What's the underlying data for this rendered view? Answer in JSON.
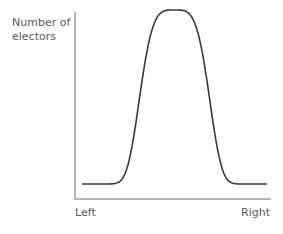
{
  "chart_data": {
    "type": "line",
    "title": "",
    "xlabel": "",
    "ylabel": "Number of electors",
    "x_tick_labels": [
      "Left",
      "Right"
    ],
    "grid": false,
    "legend": null,
    "x": [
      0,
      0.1,
      0.2,
      0.3,
      0.4,
      0.5,
      0.6,
      0.7,
      0.8,
      0.9,
      1.0
    ],
    "values": [
      0.05,
      0.1,
      0.25,
      0.55,
      0.9,
      1.0,
      0.9,
      0.55,
      0.25,
      0.1,
      0.05
    ],
    "colors": {
      "curve": "#3a3a3a",
      "axis": "#6a6a6a"
    }
  },
  "labels": {
    "ylabel_line1": "Number of",
    "ylabel_line2": "electors",
    "x_left": "Left",
    "x_right": "Right"
  }
}
